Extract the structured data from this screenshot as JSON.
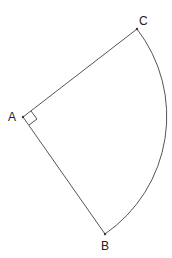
{
  "diagram": {
    "type": "sector",
    "points": {
      "A": {
        "label": "A",
        "x": 23,
        "y": 117
      },
      "B": {
        "label": "B",
        "x": 105,
        "y": 234
      },
      "C": {
        "label": "C",
        "x": 137,
        "y": 29
      }
    },
    "segments": [
      "AC",
      "AB"
    ],
    "arc": {
      "from": "C",
      "to": "B",
      "center": "A",
      "radius": 143
    },
    "right_angle_marker": {
      "at": "A"
    },
    "colors": {
      "stroke": "#555555",
      "label": "#222222",
      "background": "#ffffff"
    }
  }
}
